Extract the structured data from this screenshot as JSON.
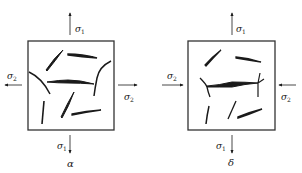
{
  "figure": {
    "panels": [
      {
        "id": "a",
        "caption": "α",
        "loading": "tension-tension",
        "labels": {
          "top": {
            "sym": "σ",
            "sub": "1"
          },
          "bottom": {
            "sym": "σ",
            "sub": "1"
          },
          "left": {
            "sym": "σ",
            "sub": "2"
          },
          "right": {
            "sym": "σ",
            "sub": "2"
          }
        },
        "arrows": {
          "top": "outward",
          "bottom": "outward",
          "left": "outward",
          "right": "outward"
        }
      },
      {
        "id": "b",
        "caption": "δ",
        "loading": "tension-compression",
        "labels": {
          "top": {
            "sym": "σ",
            "sub": "1"
          },
          "bottom": {
            "sym": "σ",
            "sub": "1"
          },
          "left": {
            "sym": "σ",
            "sub": "2"
          },
          "right": {
            "sym": "σ",
            "sub": "2"
          }
        },
        "arrows": {
          "top": "outward",
          "bottom": "outward",
          "left": "inward",
          "right": "inward"
        }
      }
    ],
    "colors": {
      "ink": "#1a1a1a",
      "frame": "#333333",
      "background": "#ffffff"
    }
  }
}
